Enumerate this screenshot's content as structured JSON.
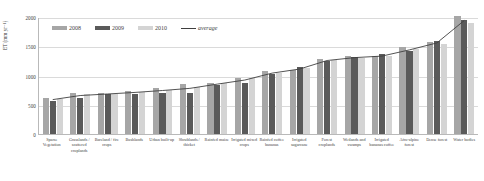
{
  "chart_data": {
    "type": "bar",
    "title": "",
    "xlabel": "",
    "ylabel": "ET (mm yr⁻¹)",
    "ylim": [
      0,
      2000
    ],
    "yticks": [
      0,
      500,
      1000,
      1500,
      2000
    ],
    "ytick_labels": [
      "0",
      "500",
      "1000",
      "1500",
      "2000"
    ],
    "grid": true,
    "legend_position": "top-left-inside",
    "categories": [
      "Sparse Vegetation",
      "Grasslands / scattered croplands",
      "Bareland / fire crops",
      "Bushlands",
      "Urban built-up",
      "Shrublands / thicket",
      "Rainfed maize",
      "Irrigated mixed crops",
      "Rainfed coffee bananas",
      "Irrigated sugarcane",
      "Forest croplands",
      "Wetlands and swamps",
      "Irrigated bananas coffee",
      "Afro-alpine forest",
      "Dense forest",
      "Water bodies"
    ],
    "series": [
      {
        "name": "2008",
        "color": "#a6a6a6",
        "values": [
          620,
          700,
          700,
          740,
          790,
          860,
          880,
          960,
          1080,
          1100,
          1290,
          1330,
          1330,
          1480,
          1580,
          2020
        ]
      },
      {
        "name": "2009",
        "color": "#5a5a5a",
        "values": [
          560,
          610,
          680,
          690,
          700,
          700,
          830,
          880,
          1030,
          1140,
          1250,
          1320,
          1360,
          1420,
          1590,
          1950
        ]
      },
      {
        "name": "2010",
        "color": "#d4d4d4",
        "values": [
          600,
          680,
          690,
          720,
          760,
          800,
          870,
          950,
          1040,
          1120,
          1260,
          1300,
          1340,
          1450,
          1540,
          1900
        ]
      }
    ],
    "average_line": {
      "name": "average",
      "color": "#3f3f3f",
      "values": [
        593,
        663,
        690,
        717,
        750,
        787,
        860,
        930,
        1050,
        1120,
        1267,
        1317,
        1343,
        1450,
        1570,
        1957
      ]
    }
  },
  "legend": {
    "items": [
      {
        "label": "2008",
        "type": "swatch",
        "key": "y2008"
      },
      {
        "label": "2009",
        "type": "swatch",
        "key": "y2009"
      },
      {
        "label": "2010",
        "type": "swatch",
        "key": "y2010"
      },
      {
        "label": "average",
        "type": "line",
        "key": "avg"
      }
    ]
  }
}
